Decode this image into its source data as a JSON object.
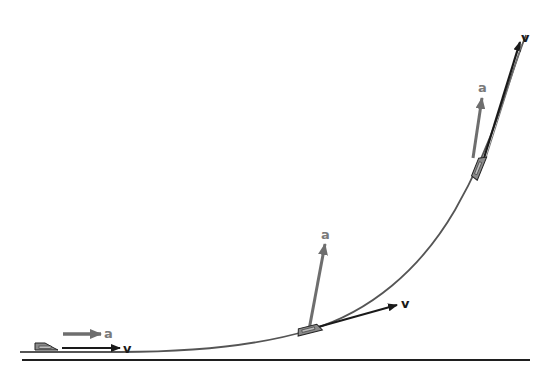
{
  "diagram": {
    "colors": {
      "background": "#ffffff",
      "ground": "#1f1f1f",
      "path": "#555555",
      "velocity": "#1a1a1a",
      "acceleration": "#6e6e6e",
      "label_v": "#1a1a1a",
      "label_a": "#7a7a7a",
      "object_fill": "#8a8a8a",
      "object_stroke": "#222222"
    },
    "labels": {
      "velocity": "v",
      "acceleration": "a"
    },
    "positions": [
      {
        "name": "start",
        "v_label": "v",
        "a_label": "a"
      },
      {
        "name": "middle",
        "v_label": "v",
        "a_label": "a"
      },
      {
        "name": "end",
        "v_label": "v",
        "a_label": "a"
      }
    ]
  }
}
